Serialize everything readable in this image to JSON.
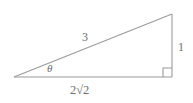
{
  "figure": {
    "type": "right-triangle-diagram",
    "background_color": "#ffffff",
    "stroke_color": "#9a9a9a",
    "label_color": "#6e6e6e"
  },
  "labels": {
    "hypotenuse": "3",
    "vertical_side": "1",
    "base": "2√2",
    "base_coefficient": "2",
    "base_radicand": "2",
    "angle": "θ"
  },
  "geometry": {
    "left_vertex": [
      14,
      77
    ],
    "right_vertex": [
      172,
      77
    ],
    "apex": [
      172,
      14
    ],
    "right_angle_marker": true,
    "right_angle_marker_size": 9
  },
  "icons": {
    "right_angle": "right-angle-marker"
  }
}
